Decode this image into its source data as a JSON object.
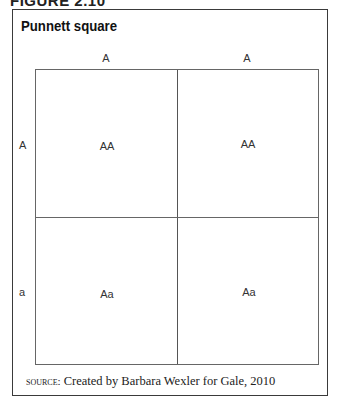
{
  "figure_label": "FIGURE 2.10",
  "title": "Punnett square",
  "columns": [
    "A",
    "A"
  ],
  "rows": [
    "A",
    "a"
  ],
  "cells": [
    [
      "AA",
      "AA"
    ],
    [
      "Aa",
      "Aa"
    ]
  ],
  "source": {
    "prefix": "source:",
    "text": "Created by Barbara Wexler for Gale, 2010"
  }
}
